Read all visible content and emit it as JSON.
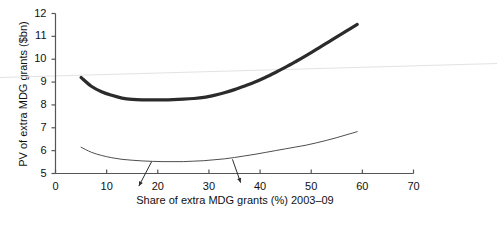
{
  "chart_data": {
    "type": "line",
    "title": "",
    "xlabel": "Share of extra MDG grants (%) 2003–09",
    "ylabel": "PV of extra MDG grants ($bn)",
    "xlim": [
      0,
      70
    ],
    "ylim": [
      5,
      12
    ],
    "xticks": [
      0,
      10,
      20,
      30,
      40,
      50,
      60,
      70
    ],
    "yticks": [
      5,
      6,
      7,
      8,
      9,
      10,
      11,
      12
    ],
    "xtick_labels": [
      "0",
      "10",
      "20",
      "30",
      "40",
      "50",
      "60",
      "70"
    ],
    "ytick_labels": [
      "5",
      "6",
      "7",
      "8",
      "9",
      "10",
      "11",
      "12"
    ],
    "grid": false,
    "legend": "none",
    "series": [
      {
        "name": "upper-thick-curve",
        "style": "thick",
        "color": "#2b2b2b",
        "width": 3.2,
        "x": [
          5,
          7,
          9,
          11,
          13,
          15,
          17,
          19,
          21,
          23,
          25,
          27,
          29,
          31,
          33,
          35,
          37,
          39,
          41,
          43,
          45,
          47,
          49,
          51,
          53,
          55,
          57,
          59
        ],
        "y": [
          9.2,
          8.82,
          8.58,
          8.42,
          8.3,
          8.24,
          8.22,
          8.22,
          8.22,
          8.23,
          8.25,
          8.28,
          8.33,
          8.42,
          8.53,
          8.67,
          8.83,
          9.0,
          9.2,
          9.42,
          9.65,
          9.9,
          10.16,
          10.43,
          10.7,
          10.98,
          11.25,
          11.52
        ]
      },
      {
        "name": "lower-thin-curve",
        "style": "thin",
        "color": "#3a3a3a",
        "width": 0.9,
        "x": [
          5,
          7,
          9,
          11,
          13,
          15,
          17,
          19,
          21,
          23,
          25,
          27,
          29,
          31,
          33,
          35,
          37,
          39,
          41,
          43,
          45,
          47,
          49,
          51,
          53,
          55,
          57,
          59
        ],
        "y": [
          6.15,
          5.93,
          5.79,
          5.69,
          5.62,
          5.58,
          5.55,
          5.53,
          5.52,
          5.52,
          5.52,
          5.54,
          5.56,
          5.6,
          5.64,
          5.7,
          5.77,
          5.84,
          5.92,
          6.0,
          6.08,
          6.16,
          6.24,
          6.34,
          6.45,
          6.57,
          6.7,
          6.83
        ]
      }
    ],
    "background_line": {
      "name": "faint-scan-line",
      "color": "#e3e3e3",
      "description": "faint near-horizontal light gray line across full image"
    },
    "annotations": [
      {
        "name": "arrow-left",
        "from_x": 18.8,
        "from_y": 5.52,
        "to_x": 16.3,
        "to_y": 4.45,
        "color": "#2b2b2b"
      },
      {
        "name": "arrow-right",
        "from_x": 34.6,
        "from_y": 5.62,
        "to_x": 36.2,
        "to_y": 4.6,
        "color": "#2b2b2b"
      }
    ],
    "axis_color": "#555555"
  }
}
